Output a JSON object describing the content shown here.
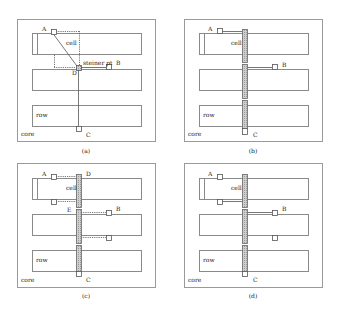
{
  "colors": {
    "stroke": "#8a8a8a",
    "frame": "#9a9a9a",
    "feedthrough_fill": "#c4c4c4",
    "text": "#222222",
    "background": "#ffffff"
  },
  "panels": [
    {
      "id": "a",
      "caption": "(a)",
      "frame": {
        "x": 17,
        "y": 19,
        "w": 138,
        "h": 122
      },
      "rows": [
        {
          "x": 32,
          "y": 33,
          "w": 109,
          "h": 21
        },
        {
          "x": 32,
          "y": 69,
          "w": 109,
          "h": 21
        },
        {
          "x": 32,
          "y": 105,
          "w": 109,
          "h": 21
        }
      ],
      "cell_divider_x": 37,
      "labels": [
        {
          "text": "A",
          "x": 42,
          "y": 31
        },
        {
          "text": "cell",
          "x": 66,
          "y": 45
        },
        {
          "text": "steiner pt",
          "x": 83,
          "y": 65
        },
        {
          "text": "B",
          "x": 116,
          "y": 65
        },
        {
          "text": "D",
          "x": 72,
          "y": 75
        },
        {
          "text": "row",
          "x": 36,
          "y": 117
        },
        {
          "text": "core",
          "x": 21,
          "y": 136
        },
        {
          "text": "C",
          "x": 86,
          "y": 137
        }
      ],
      "pins": [
        {
          "name": "A",
          "x": 51,
          "y": 29,
          "w": 5,
          "h": 5
        },
        {
          "name": "B",
          "x": 106,
          "y": 64,
          "w": 5,
          "h": 5
        },
        {
          "name": "C",
          "x": 76,
          "y": 126,
          "w": 5,
          "h": 5
        }
      ],
      "steiner": {
        "x": 76,
        "y": 65,
        "w": 5,
        "h": 5
      },
      "lines": [
        {
          "x1": 53,
          "y1": 33,
          "x2": 78,
          "y2": 67,
          "dash": false
        },
        {
          "x1": 81,
          "y1": 67,
          "x2": 106,
          "y2": 67,
          "dash": false
        },
        {
          "x1": 78,
          "y1": 70,
          "x2": 78,
          "y2": 126,
          "dash": false
        },
        {
          "x1": 56,
          "y1": 31,
          "x2": 79,
          "y2": 31,
          "dash": true
        },
        {
          "x1": 79,
          "y1": 31,
          "x2": 79,
          "y2": 65,
          "dash": true
        },
        {
          "x1": 54,
          "y1": 55,
          "x2": 54,
          "y2": 67,
          "dash": true
        },
        {
          "x1": 54,
          "y1": 67,
          "x2": 76,
          "y2": 67,
          "dash": true
        }
      ],
      "bars": []
    },
    {
      "id": "b",
      "caption": "(b)",
      "frame": {
        "x": 184,
        "y": 19,
        "w": 138,
        "h": 122
      },
      "rows": [
        {
          "x": 199,
          "y": 33,
          "w": 109,
          "h": 21
        },
        {
          "x": 199,
          "y": 69,
          "w": 109,
          "h": 21
        },
        {
          "x": 199,
          "y": 105,
          "w": 109,
          "h": 21
        }
      ],
      "cell_divider_x": 204,
      "labels": [
        {
          "text": "A",
          "x": 208,
          "y": 31
        },
        {
          "text": "cell",
          "x": 231,
          "y": 45
        },
        {
          "text": "B",
          "x": 282,
          "y": 67
        },
        {
          "text": "row",
          "x": 203,
          "y": 117
        },
        {
          "text": "core",
          "x": 188,
          "y": 136
        },
        {
          "text": "C",
          "x": 253,
          "y": 137
        }
      ],
      "pins": [
        {
          "name": "A",
          "x": 217,
          "y": 28,
          "w": 5,
          "h": 5
        },
        {
          "name": "B",
          "x": 272,
          "y": 64,
          "w": 5,
          "h": 5
        },
        {
          "name": "C",
          "x": 242,
          "y": 128,
          "w": 5,
          "h": 6
        }
      ],
      "steiner": null,
      "lines": [
        {
          "x1": 222,
          "y1": 31,
          "x2": 242,
          "y2": 31,
          "dash": false
        },
        {
          "x1": 247,
          "y1": 67,
          "x2": 272,
          "y2": 67,
          "dash": false
        }
      ],
      "bars": [
        {
          "x": 242,
          "y": 29,
          "w": 5,
          "h": 33
        },
        {
          "x": 242,
          "y": 64,
          "w": 5,
          "h": 34
        },
        {
          "x": 242,
          "y": 100,
          "w": 5,
          "h": 28
        }
      ]
    },
    {
      "id": "c",
      "caption": "(c)",
      "frame": {
        "x": 17,
        "y": 163,
        "w": 138,
        "h": 124
      },
      "rows": [
        {
          "x": 32,
          "y": 178,
          "w": 109,
          "h": 21
        },
        {
          "x": 32,
          "y": 214,
          "w": 109,
          "h": 21
        },
        {
          "x": 32,
          "y": 250,
          "w": 109,
          "h": 21
        }
      ],
      "cell_divider_x": 37,
      "labels": [
        {
          "text": "A",
          "x": 42,
          "y": 176
        },
        {
          "text": "D",
          "x": 86,
          "y": 176
        },
        {
          "text": "cell",
          "x": 66,
          "y": 190
        },
        {
          "text": "E",
          "x": 67,
          "y": 212
        },
        {
          "text": "B",
          "x": 116,
          "y": 211
        },
        {
          "text": "row",
          "x": 36,
          "y": 262
        },
        {
          "text": "core",
          "x": 21,
          "y": 282
        },
        {
          "text": "C",
          "x": 86,
          "y": 282
        }
      ],
      "pins": [
        {
          "name": "A",
          "x": 51,
          "y": 174,
          "w": 5,
          "h": 5
        },
        {
          "name": "A2",
          "x": 51,
          "y": 199,
          "w": 5,
          "h": 5
        },
        {
          "name": "B",
          "x": 106,
          "y": 210,
          "w": 5,
          "h": 5
        },
        {
          "name": "B2",
          "x": 106,
          "y": 235,
          "w": 5,
          "h": 5
        },
        {
          "name": "C",
          "x": 76,
          "y": 271,
          "w": 5,
          "h": 5
        }
      ],
      "steiner": null,
      "lines": [
        {
          "x1": 56,
          "y1": 176,
          "x2": 76,
          "y2": 176,
          "dash": true
        },
        {
          "x1": 56,
          "y1": 201,
          "x2": 76,
          "y2": 201,
          "dash": true
        },
        {
          "x1": 81,
          "y1": 212,
          "x2": 106,
          "y2": 212,
          "dash": true
        },
        {
          "x1": 81,
          "y1": 237,
          "x2": 106,
          "y2": 237,
          "dash": true
        }
      ],
      "bars": [
        {
          "x": 76,
          "y": 174,
          "w": 5,
          "h": 33
        },
        {
          "x": 76,
          "y": 209,
          "w": 5,
          "h": 34
        },
        {
          "x": 76,
          "y": 245,
          "w": 5,
          "h": 26
        }
      ]
    },
    {
      "id": "d",
      "caption": "(d)",
      "frame": {
        "x": 184,
        "y": 163,
        "w": 138,
        "h": 124
      },
      "rows": [
        {
          "x": 199,
          "y": 178,
          "w": 109,
          "h": 21
        },
        {
          "x": 199,
          "y": 214,
          "w": 109,
          "h": 21
        },
        {
          "x": 199,
          "y": 250,
          "w": 109,
          "h": 21
        }
      ],
      "cell_divider_x": 204,
      "labels": [
        {
          "text": "A",
          "x": 208,
          "y": 176
        },
        {
          "text": "cell",
          "x": 231,
          "y": 190
        },
        {
          "text": "B",
          "x": 282,
          "y": 211
        },
        {
          "text": "row",
          "x": 203,
          "y": 262
        },
        {
          "text": "core",
          "x": 188,
          "y": 282
        },
        {
          "text": "C",
          "x": 253,
          "y": 282
        }
      ],
      "pins": [
        {
          "name": "A",
          "x": 217,
          "y": 174,
          "w": 5,
          "h": 5
        },
        {
          "name": "A2",
          "x": 217,
          "y": 199,
          "w": 5,
          "h": 5
        },
        {
          "name": "B",
          "x": 272,
          "y": 210,
          "w": 5,
          "h": 5
        },
        {
          "name": "B2",
          "x": 272,
          "y": 235,
          "w": 5,
          "h": 5
        },
        {
          "name": "C",
          "x": 242,
          "y": 271,
          "w": 5,
          "h": 5
        }
      ],
      "steiner": null,
      "lines": [
        {
          "x1": 222,
          "y1": 201,
          "x2": 242,
          "y2": 201,
          "dash": false
        },
        {
          "x1": 247,
          "y1": 212,
          "x2": 272,
          "y2": 212,
          "dash": false
        }
      ],
      "bars": [
        {
          "x": 242,
          "y": 174,
          "w": 5,
          "h": 33
        },
        {
          "x": 242,
          "y": 209,
          "w": 5,
          "h": 34
        },
        {
          "x": 242,
          "y": 245,
          "w": 5,
          "h": 26
        }
      ]
    }
  ],
  "captions": [
    {
      "text": "(a)",
      "x": 86,
      "y": 153
    },
    {
      "text": "(b)",
      "x": 253,
      "y": 153
    },
    {
      "text": "(c)",
      "x": 86,
      "y": 298
    },
    {
      "text": "(d)",
      "x": 253,
      "y": 298
    }
  ]
}
